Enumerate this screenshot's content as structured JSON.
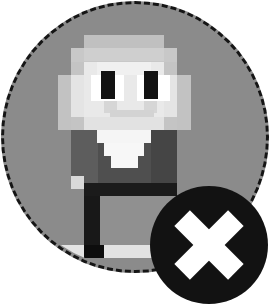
{
  "widget": {
    "name": "avatar-remove-control",
    "label": "Avatar",
    "alt_text": "Pixel art character avatar",
    "remove_label": "Remove",
    "remove_icon": "close-x-icon",
    "frame_icon": "dashed-circle-frame"
  },
  "colors": {
    "page_background": "#ffffff",
    "frame_fill": "#8b8b8b",
    "frame_border": "#151515",
    "badge_fill": "#121212",
    "badge_glyph": "#ffffff",
    "hair_light": "#c8c8c8",
    "hair_mid": "#b4b4b4",
    "face_light": "#ebebeb",
    "face_white": "#f7f7f7",
    "face_shadow": "#d8d8d8",
    "eye": "#111111",
    "eye_white": "#ffffff",
    "shirt_dark": "#4a4a4a",
    "shirt_mid": "#5c5c5c",
    "collar": "#f2f2f2",
    "leg_dark": "#1c1c1c",
    "shoe_light": "#e0e0e0",
    "shoe_dark": "#0d0d0d"
  },
  "sprite": {
    "type": "pixel-art",
    "pixel_size": 13.3,
    "grid_origin_x": 58,
    "grid_origin_y": 35,
    "columns": 11,
    "rows": 15,
    "description": "Grayscale pixel character: pale face with dark eyes, light hair, dark torso, white collar, dark legs and light shoe"
  },
  "badge": {
    "center_x": 209,
    "center_y": 245,
    "radius": 59,
    "glyph": "X"
  }
}
